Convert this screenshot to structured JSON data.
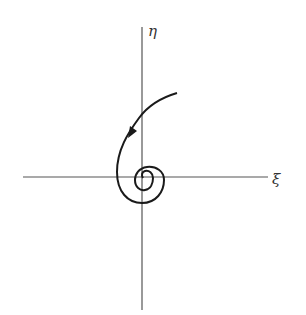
{
  "diagram": {
    "type": "phase-portrait",
    "axes": {
      "horizontal_label": "ξ",
      "vertical_label": "η",
      "color": "#555555"
    },
    "trajectory": {
      "kind": "inward spiral (stable focus)",
      "direction_arrow": "toward origin",
      "color": "#1a1a1a"
    }
  }
}
